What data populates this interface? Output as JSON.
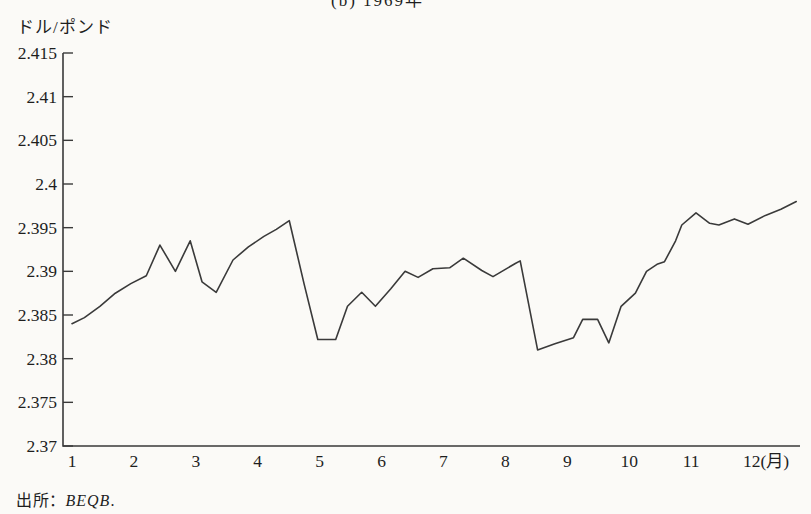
{
  "page": {
    "title_partial": "(b) 1969年",
    "y_axis_unit_label": "ドル/ポンド",
    "source_prefix": "出所：",
    "source_value": "BEQB",
    "source_suffix": "."
  },
  "colors": {
    "background": "#fbfaf7",
    "line": "#3a3a3a",
    "axis": "#3a3a3a",
    "text": "#1e1e1e"
  },
  "chart_data": {
    "type": "line",
    "title": "(b) 1969年",
    "ylabel": "ドル/ポンド",
    "x_unit_suffix": "(月)",
    "xlabel": "月",
    "ylim": [
      2.37,
      2.415
    ],
    "xlim": [
      1,
      12.75
    ],
    "grid": false,
    "legend": "none",
    "y_ticks": [
      {
        "label": "2.415",
        "value": 2.415
      },
      {
        "label": "2.41",
        "value": 2.41
      },
      {
        "label": "2.405",
        "value": 2.405
      },
      {
        "label": "2.4",
        "value": 2.4
      },
      {
        "label": "2.395",
        "value": 2.395
      },
      {
        "label": "2.39",
        "value": 2.39
      },
      {
        "label": "2.385",
        "value": 2.385
      },
      {
        "label": "2.38",
        "value": 2.38
      },
      {
        "label": "2.375",
        "value": 2.375
      },
      {
        "label": "2.37",
        "value": 2.37
      }
    ],
    "x_ticks": [
      {
        "label": "1",
        "month": 1
      },
      {
        "label": "2",
        "month": 2
      },
      {
        "label": "3",
        "month": 3
      },
      {
        "label": "4",
        "month": 4
      },
      {
        "label": "5",
        "month": 5
      },
      {
        "label": "6",
        "month": 6
      },
      {
        "label": "7",
        "month": 7
      },
      {
        "label": "8",
        "month": 8
      },
      {
        "label": "9",
        "month": 9
      },
      {
        "label": "10",
        "month": 10
      },
      {
        "label": "11",
        "month": 11
      },
      {
        "label": "12(月)",
        "month": 12
      }
    ],
    "series": [
      {
        "name": "dollar-pound-exchange-rate",
        "points": [
          [
            1.0,
            2.384
          ],
          [
            1.2,
            2.3847
          ],
          [
            1.45,
            2.386
          ],
          [
            1.7,
            2.3875
          ],
          [
            1.95,
            2.3886
          ],
          [
            2.2,
            2.3895
          ],
          [
            2.42,
            2.393
          ],
          [
            2.67,
            2.39
          ],
          [
            2.91,
            2.3935
          ],
          [
            3.1,
            2.3888
          ],
          [
            3.33,
            2.3876
          ],
          [
            3.6,
            2.3913
          ],
          [
            3.85,
            2.3928
          ],
          [
            4.1,
            2.394
          ],
          [
            4.3,
            2.3948
          ],
          [
            4.51,
            2.3958
          ],
          [
            4.75,
            2.3885
          ],
          [
            4.97,
            2.3822
          ],
          [
            5.26,
            2.3822
          ],
          [
            5.45,
            2.386
          ],
          [
            5.68,
            2.3876
          ],
          [
            5.9,
            2.386
          ],
          [
            6.15,
            2.388
          ],
          [
            6.38,
            2.39
          ],
          [
            6.59,
            2.3893
          ],
          [
            6.83,
            2.3903
          ],
          [
            7.1,
            2.3904
          ],
          [
            7.32,
            2.3915
          ],
          [
            7.62,
            2.3901
          ],
          [
            7.8,
            2.3894
          ],
          [
            8.16,
            2.3909
          ],
          [
            8.24,
            2.3912
          ],
          [
            8.52,
            2.381
          ],
          [
            8.8,
            2.3817
          ],
          [
            9.1,
            2.3824
          ],
          [
            9.25,
            2.3845
          ],
          [
            9.49,
            2.3845
          ],
          [
            9.67,
            2.3818
          ],
          [
            9.87,
            2.386
          ],
          [
            10.1,
            2.3875
          ],
          [
            10.28,
            2.39
          ],
          [
            10.45,
            2.3908
          ],
          [
            10.57,
            2.3911
          ],
          [
            10.75,
            2.3935
          ],
          [
            10.85,
            2.3953
          ],
          [
            11.08,
            2.3967
          ],
          [
            11.3,
            2.3955
          ],
          [
            11.45,
            2.3953
          ],
          [
            11.7,
            2.396
          ],
          [
            11.92,
            2.3954
          ],
          [
            12.2,
            2.3964
          ],
          [
            12.45,
            2.3971
          ],
          [
            12.7,
            2.398
          ]
        ]
      }
    ],
    "source": "出所：BEQB."
  }
}
